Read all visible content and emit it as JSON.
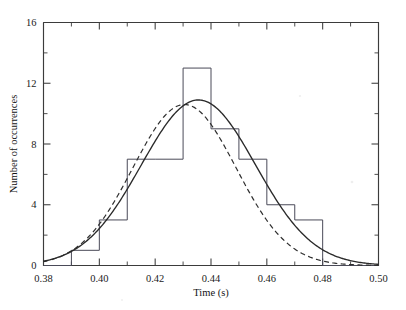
{
  "chart_data": {
    "type": "bar",
    "title": "",
    "subtitle": "",
    "xlabel": "Time (s)",
    "ylabel": "Number of occurrences",
    "xlim": [
      0.38,
      0.5
    ],
    "ylim": [
      0,
      16
    ],
    "grid": false,
    "legend": "none",
    "xticks": [
      0.38,
      0.4,
      0.42,
      0.44,
      0.46,
      0.48,
      0.5
    ],
    "xticklabels": [
      "0.38",
      "0.40",
      "0.42",
      "0.44",
      "0.46",
      "0.48",
      "0.50"
    ],
    "xminor_step": 0.01,
    "yticks": [
      0,
      4,
      8,
      12,
      16
    ],
    "yticklabels": [
      "0",
      "4",
      "8",
      "12",
      "16"
    ],
    "yminor_step": 2,
    "bin_width": 0.01,
    "bin_edges": [
      0.38,
      0.39,
      0.4,
      0.41,
      0.42,
      0.43,
      0.44,
      0.45,
      0.46,
      0.47,
      0.48,
      0.49,
      0.5
    ],
    "values": [
      0,
      1,
      3,
      7,
      7,
      13,
      9,
      7,
      4,
      3,
      0,
      0
    ],
    "categories": [
      "0.38-0.39",
      "0.39-0.40",
      "0.40-0.41",
      "0.41-0.42",
      "0.42-0.43",
      "0.43-0.44",
      "0.44-0.45",
      "0.45-0.46",
      "0.46-0.47",
      "0.47-0.48",
      "0.48-0.49",
      "0.49-0.50"
    ],
    "series": [
      {
        "name": "histogram",
        "style": "step-outline",
        "values": [
          0,
          1,
          3,
          7,
          7,
          13,
          9,
          7,
          4,
          3,
          0,
          0
        ]
      },
      {
        "name": "gaussian-fit-solid",
        "style": "solid-curve",
        "peak_value": 10.9,
        "peak_x": 0.4355,
        "sigma": 0.0205
      },
      {
        "name": "gaussian-fit-dashed",
        "style": "dashed-curve",
        "peak_value": 10.6,
        "peak_x": 0.4305,
        "sigma": 0.0185
      }
    ],
    "annotations": []
  },
  "figure": {
    "axis_color": "#3b3b3b",
    "histogram_color": "#4a4a58",
    "curve_color": "#2a2a2a",
    "background": "#ffffff"
  }
}
